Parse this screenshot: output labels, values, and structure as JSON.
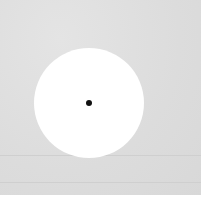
{
  "image": {
    "description": "White circular disc on a light grey textured background with a small black dot at its center",
    "colors": {
      "background": "#dcdcdc",
      "disc": "#ffffff",
      "dot": "#111111"
    }
  }
}
